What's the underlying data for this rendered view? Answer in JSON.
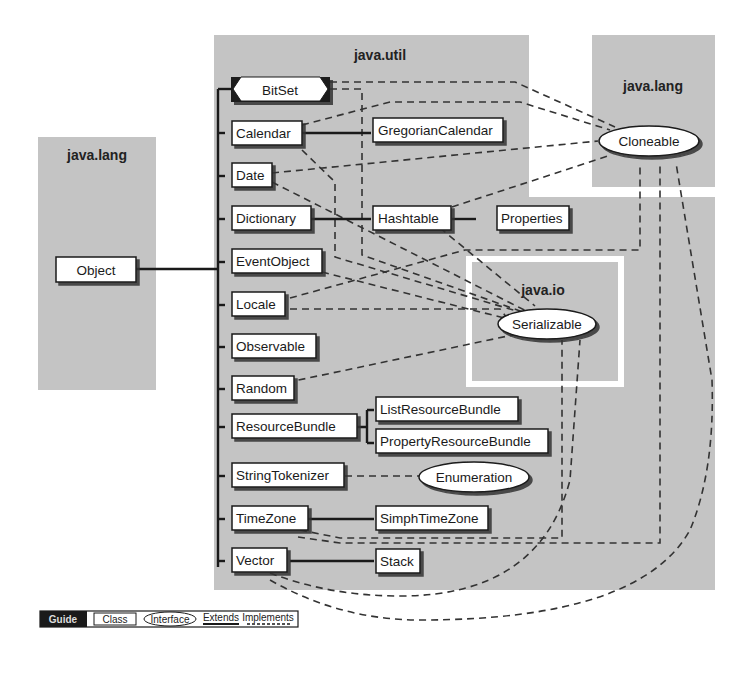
{
  "packages": {
    "java_lang_left": "java.lang",
    "java_util": "java.util",
    "java_lang_right": "java.lang",
    "java_io": "java.io"
  },
  "classes": {
    "object": "Object",
    "bitset": "BitSet",
    "calendar": "Calendar",
    "gregorian_calendar": "GregorianCalendar",
    "date": "Date",
    "dictionary": "Dictionary",
    "hashtable": "Hashtable",
    "properties": "Properties",
    "event_object": "EventObject",
    "locale": "Locale",
    "observable": "Observable",
    "random": "Random",
    "resource_bundle": "ResourceBundle",
    "list_resource_bundle": "ListResourceBundle",
    "property_resource_bundle": "PropertyResourceBundle",
    "string_tokenizer": "StringTokenizer",
    "time_zone": "TimeZone",
    "simple_time_zone": "SimphTimeZone",
    "vector": "Vector",
    "stack": "Stack"
  },
  "interfaces": {
    "cloneable": "Cloneable",
    "serializable": "Serializable",
    "enumeration": "Enumeration"
  },
  "guide": {
    "title": "Guide",
    "class_label": "Class",
    "interface_label": "Interface",
    "extends_label": "Extends",
    "implements_label": "Implements"
  },
  "colors": {
    "package_bg": "#c4c4c4",
    "box_fill": "#ffffff",
    "line": "#1a1a1a",
    "guide_dark": "#1a1a1a"
  }
}
